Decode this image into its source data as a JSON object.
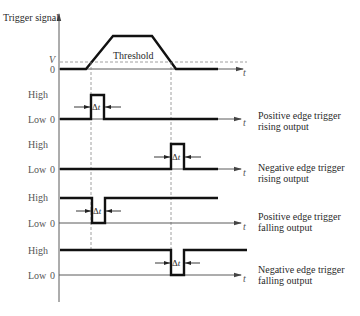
{
  "figure": {
    "y_axis_label": "Trigger signal",
    "time_label": "t",
    "delta_symbol": "Δ"
  },
  "trigger": {
    "threshold_label": "Threshold",
    "v_label": "V",
    "zero_label": "0"
  },
  "rows": [
    {
      "high_label": "High",
      "low_label": "Low",
      "zero_label": "0",
      "title_line1": "Positive edge trigger",
      "title_line2": "rising output"
    },
    {
      "high_label": "High",
      "low_label": "Low",
      "zero_label": "0",
      "title_line1": "Negative edge trigger",
      "title_line2": "rising output"
    },
    {
      "high_label": "High",
      "low_label": "Low",
      "zero_label": "0",
      "title_line1": "Positive edge trigger",
      "title_line2": "falling output"
    },
    {
      "high_label": "High",
      "low_label": "Low",
      "zero_label": "0",
      "title_line1": "Negative edge trigger",
      "title_line2": "falling output"
    }
  ]
}
